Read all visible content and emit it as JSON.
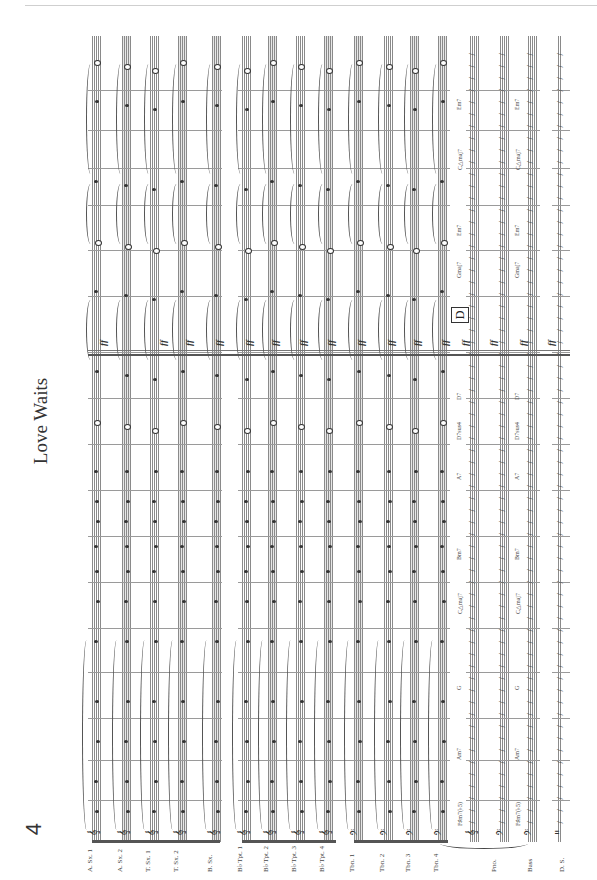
{
  "page": {
    "number": "4",
    "title": "Love Waits",
    "orientation": "rotated-90"
  },
  "rehearsal_mark": "D",
  "instruments": [
    {
      "label": "A. Sx. 1",
      "clef": "treble"
    },
    {
      "label": "A. Sx. 2",
      "clef": "treble"
    },
    {
      "label": "T. Sx. 1",
      "clef": "treble"
    },
    {
      "label": "T. Sx. 2",
      "clef": "treble"
    },
    {
      "label": "B. Sx.",
      "clef": "treble"
    },
    {
      "label": "B♭ Tpt. 1",
      "clef": "treble"
    },
    {
      "label": "B♭ Tpt. 2",
      "clef": "treble"
    },
    {
      "label": "B♭ Tpt. 3",
      "clef": "treble"
    },
    {
      "label": "B♭ Tpt. 4",
      "clef": "treble"
    },
    {
      "label": "Tbn. 1",
      "clef": "bass"
    },
    {
      "label": "Tbn. 2",
      "clef": "bass"
    },
    {
      "label": "Tbn. 3",
      "clef": "bass"
    },
    {
      "label": "Tbn. 4",
      "clef": "bass"
    },
    {
      "label": "Pno.",
      "clef": "grand"
    },
    {
      "label": "Bass",
      "clef": "bass"
    },
    {
      "label": "D. S.",
      "clef": "percussion"
    }
  ],
  "chords": [
    "F♯m7(♭5)",
    "Am7",
    "G",
    "C△maj7",
    "Bm7",
    "A7",
    "D7sus4",
    "D7",
    "Gmaj7",
    "Em7",
    "C△maj7",
    "Em7"
  ],
  "dynamics": {
    "section_d": "ff"
  }
}
